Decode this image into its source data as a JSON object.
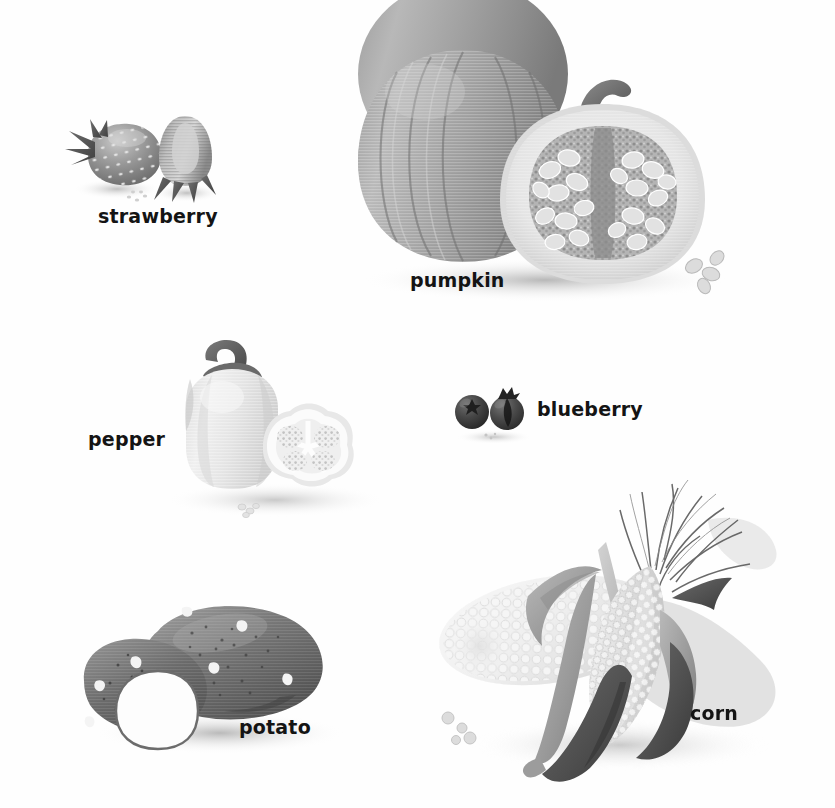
{
  "page": {
    "background_color": "#fefefe",
    "width": 835,
    "height": 808,
    "style": "grayscale educational illustration, whole and cross-section views"
  },
  "palette": {
    "label_text": "#141414",
    "dark_gray": "#4a4a4a",
    "mid_gray": "#7e7e7e",
    "light_gray": "#b9b9b9",
    "pale_gray": "#dedede",
    "near_white": "#f2f2f2",
    "shadow": "#c9c9c9",
    "blueberry_dark": "#3c3c3c",
    "potato_dark": "#5f5f5f"
  },
  "specimens": [
    {
      "id": "strawberry",
      "label": "strawberry",
      "label_x": 98,
      "label_y": 205,
      "views": [
        "whole",
        "cross-section"
      ],
      "tone": "mid-gray stippled with seeds and sepals"
    },
    {
      "id": "pumpkin",
      "label": "pumpkin",
      "label_x": 410,
      "label_y": 269,
      "views": [
        "whole",
        "cross-section"
      ],
      "tone": "ribbed mid-gray with pale seed cavity"
    },
    {
      "id": "pepper",
      "label": "pepper",
      "label_x": 88,
      "label_y": 428,
      "views": [
        "whole",
        "cross-section"
      ],
      "tone": "very pale gray bell pepper with dark stem"
    },
    {
      "id": "blueberry",
      "label": "blueberry",
      "label_x": 537,
      "label_y": 398,
      "views": [
        "whole",
        "cross-section"
      ],
      "tone": "dark near-black berries with crown"
    },
    {
      "id": "potato",
      "label": "potato",
      "label_x": 239,
      "label_y": 716,
      "views": [
        "whole",
        "cut"
      ],
      "tone": "dark gray tubers with eyes, white cut face"
    },
    {
      "id": "corn",
      "label": "corn",
      "label_x": 690,
      "label_y": 702,
      "views": [
        "husked ear with silk and leaves",
        "bare cob"
      ],
      "tone": "pale kernels with mid and dark gray husk leaves"
    }
  ]
}
